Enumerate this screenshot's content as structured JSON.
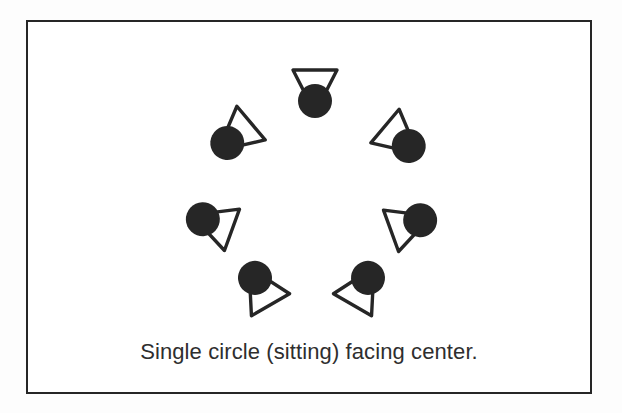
{
  "page": {
    "background_color": "#ffffff",
    "ink_color": "#262626"
  },
  "diagram": {
    "title_caption": "Single circle (sitting) facing center.",
    "frame": {
      "border_color": "#262626",
      "fill_color": "#ffffff"
    },
    "formation_name": "single-circle-facing-center",
    "participant_count": 7,
    "center": {
      "x": 283,
      "y": 168
    },
    "symbol_legend": {
      "head": "filled-circle",
      "body": "hollow-triangle",
      "facing": "triangle-apex-points-toward-center"
    },
    "participants": [
      {
        "id": "person-1",
        "position": "top",
        "x": 287,
        "y": 65,
        "rotation_deg": 180,
        "facing": "down"
      },
      {
        "id": "person-2",
        "position": "upper-left",
        "x": 210,
        "y": 112,
        "rotation_deg": 230,
        "facing": "down-right"
      },
      {
        "id": "person-3",
        "position": "upper-right",
        "x": 370,
        "y": 115,
        "rotation_deg": 130,
        "facing": "down-left"
      },
      {
        "id": "person-4",
        "position": "middle-left",
        "x": 188,
        "y": 202,
        "rotation_deg": 290,
        "facing": "right"
      },
      {
        "id": "person-5",
        "position": "middle-right",
        "x": 379,
        "y": 203,
        "rotation_deg": 70,
        "facing": "left"
      },
      {
        "id": "person-6",
        "position": "lower-left",
        "x": 234,
        "y": 268,
        "rotation_deg": 330,
        "facing": "up-right"
      },
      {
        "id": "person-7",
        "position": "lower-right",
        "x": 333,
        "y": 268,
        "rotation_deg": 30,
        "facing": "up-left"
      }
    ]
  }
}
